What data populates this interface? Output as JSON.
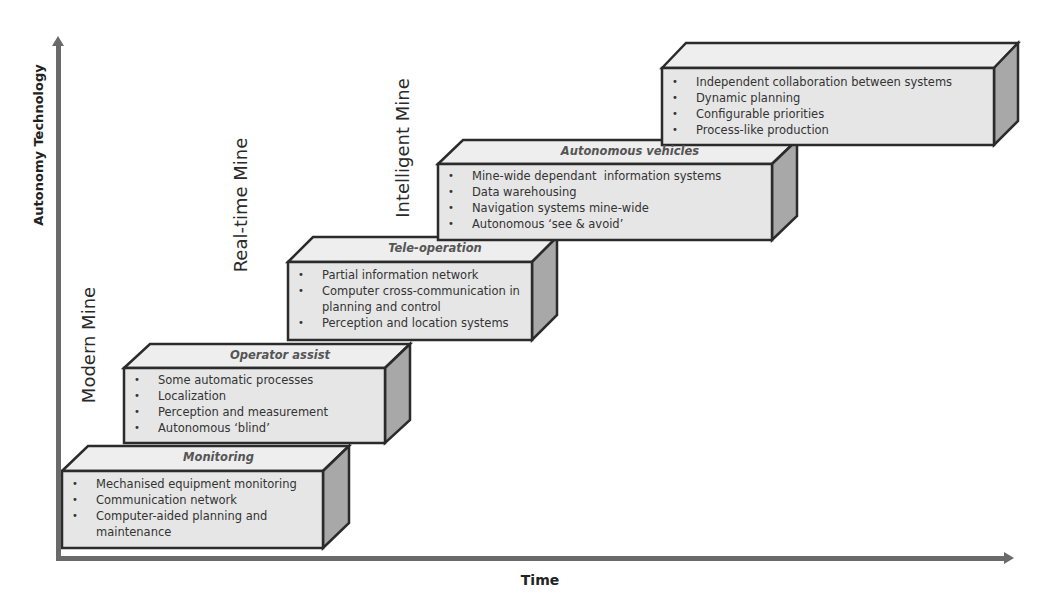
{
  "axes": {
    "y_label": "Autonomy Technology",
    "x_label": "Time"
  },
  "stages": [
    {
      "label": "Modern Mine"
    },
    {
      "label": "Real-time Mine"
    },
    {
      "label": "Intelligent Mine"
    }
  ],
  "colors": {
    "box_front": "#e6e6e6",
    "box_top": "#eeeeee",
    "box_side": "#a8a8a8",
    "outline": "#2b2b2b",
    "axis": "#6a6a6a"
  },
  "steps": [
    {
      "title": "Monitoring",
      "items": [
        "Mechanised equipment monitoring",
        "Communication network",
        "Computer-aided planning and maintenance"
      ]
    },
    {
      "title": "Operator assist",
      "items": [
        "Some automatic processes",
        "Localization",
        "Perception and measurement",
        "Autonomous ‘blind’"
      ]
    },
    {
      "title": "Tele-operation",
      "items": [
        "Partial information network",
        "Computer cross-communication in planning and control",
        "Perception and location systems"
      ]
    },
    {
      "title": "Autonomous vehicles",
      "items": [
        "Mine-wide dependant  information systems",
        "Data warehousing",
        "Navigation systems mine-wide",
        "Autonomous ‘see & avoid’"
      ]
    },
    {
      "title": "",
      "items": [
        "Independent collaboration between systems",
        "Dynamic planning",
        "Configurable priorities",
        "Process-like production"
      ]
    }
  ]
}
